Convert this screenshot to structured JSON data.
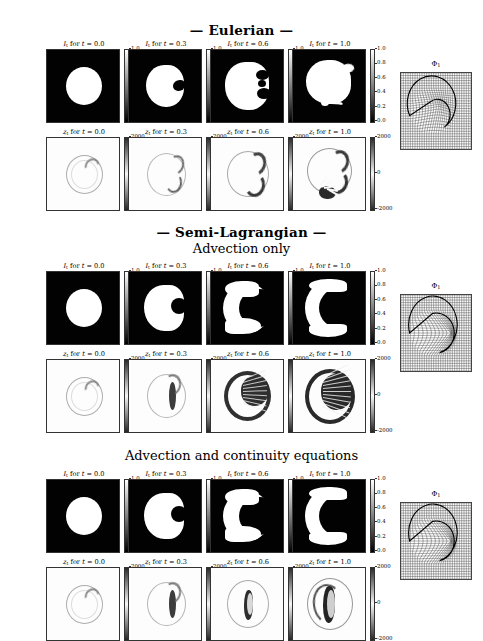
{
  "figure": {
    "width": 483,
    "height": 641,
    "background": "#ffffff",
    "kind": "scientific-figure-grid"
  },
  "sections": [
    {
      "id": "eulerian",
      "title": "—  Eulerian  —",
      "subtitle": null,
      "title_y": 22,
      "rows": [
        {
          "id": "eulerian-It",
          "quantity": "I",
          "quantity_sub": "t",
          "y": 40,
          "cmap": "gray",
          "cbar_ticks": [
            "1.0",
            "0.8",
            "0.6",
            "0.4",
            "0.2",
            "0.0"
          ],
          "panels": [
            {
              "time": "0.0",
              "label": "I_t for t = 0.0",
              "shape": "circle"
            },
            {
              "time": "0.3",
              "label": "I_t for t = 0.3",
              "shape": "notched-circle"
            },
            {
              "time": "0.6",
              "label": "I_t for t = 0.6",
              "shape": "lobed-blob"
            },
            {
              "time": "1.0",
              "label": "I_t for t = 1.0",
              "shape": "blob-with-spray"
            }
          ]
        },
        {
          "id": "eulerian-zt",
          "quantity": "z",
          "quantity_sub": "t",
          "y": 128,
          "cmap": "diverging",
          "cbar_ticks": [
            "2000",
            "0",
            "-2000"
          ],
          "panels": [
            {
              "time": "0.0",
              "label": "z_t for t = 0.0",
              "shape": "ring-faint"
            },
            {
              "time": "0.3",
              "label": "z_t for t = 0.3",
              "shape": "ring-arc"
            },
            {
              "time": "0.6",
              "label": "z_t for t = 0.6",
              "shape": "ring-arc-strong"
            },
            {
              "time": "1.0",
              "label": "z_t for t = 1.0",
              "shape": "ring-blot"
            }
          ]
        }
      ],
      "phi": {
        "label": "Φ",
        "label_sub": "1",
        "style": "eulerian-warp",
        "y": 60
      }
    },
    {
      "id": "semi-lagrangian-advection",
      "title": "—  Semi-Lagrangian  —",
      "subtitle": "Advection only",
      "title_y": 224,
      "subtitle_y": 241,
      "rows": [
        {
          "id": "sl-adv-It",
          "quantity": "I",
          "quantity_sub": "t",
          "y": 262,
          "cmap": "gray",
          "cbar_ticks": [
            "1.0",
            "0.8",
            "0.6",
            "0.4",
            "0.2",
            "0.0"
          ],
          "panels": [
            {
              "time": "0.0",
              "label": "I_t for t = 0.0",
              "shape": "circle"
            },
            {
              "time": "0.3",
              "label": "I_t for t = 0.3",
              "shape": "dented-disc"
            },
            {
              "time": "0.6",
              "label": "I_t for t = 0.6",
              "shape": "crescent"
            },
            {
              "time": "1.0",
              "label": "I_t for t = 1.0",
              "shape": "crescent-open"
            }
          ]
        },
        {
          "id": "sl-adv-zt",
          "quantity": "z",
          "quantity_sub": "t",
          "y": 350,
          "cmap": "diverging",
          "cbar_ticks": [
            "2000",
            "0",
            "-2000"
          ],
          "panels": [
            {
              "time": "0.0",
              "label": "z_t for t = 0.0",
              "shape": "ring-faint"
            },
            {
              "time": "0.3",
              "label": "z_t for t = 0.3",
              "shape": "ring-streak"
            },
            {
              "time": "0.6",
              "label": "z_t for t = 0.6",
              "shape": "crescent-dark"
            },
            {
              "time": "1.0",
              "label": "z_t for t = 1.0",
              "shape": "crescent-dark-open"
            }
          ]
        }
      ],
      "phi": {
        "label": "Φ",
        "label_sub": "1",
        "style": "crescent-warp",
        "y": 282
      }
    },
    {
      "id": "semi-lagrangian-continuity",
      "title": null,
      "subtitle": "Advection and continuity equations",
      "subtitle_y": 448,
      "rows": [
        {
          "id": "sl-cont-It",
          "quantity": "I",
          "quantity_sub": "t",
          "y": 470,
          "cmap": "gray",
          "cbar_ticks": [
            "1.0",
            "0.8",
            "0.6",
            "0.4",
            "0.2",
            "0.0"
          ],
          "panels": [
            {
              "time": "0.0",
              "label": "I_t for t = 0.0",
              "shape": "circle"
            },
            {
              "time": "0.3",
              "label": "I_t for t = 0.3",
              "shape": "dented-disc"
            },
            {
              "time": "0.6",
              "label": "I_t for t = 0.6",
              "shape": "crescent"
            },
            {
              "time": "1.0",
              "label": "I_t for t = 1.0",
              "shape": "crescent-open"
            }
          ]
        },
        {
          "id": "sl-cont-zt",
          "quantity": "z",
          "quantity_sub": "t",
          "y": 558,
          "cmap": "diverging",
          "cbar_ticks": [
            "2000",
            "0",
            "-2000"
          ],
          "panels": [
            {
              "time": "0.0",
              "label": "z_t for t = 0.0",
              "shape": "ring-faint"
            },
            {
              "time": "0.3",
              "label": "z_t for t = 0.3",
              "shape": "ring-streak"
            },
            {
              "time": "0.6",
              "label": "z_t for t = 0.6",
              "shape": "arc-thin"
            },
            {
              "time": "1.0",
              "label": "z_t for t = 1.0",
              "shape": "arc-thin-strong"
            }
          ]
        }
      ],
      "phi": {
        "label": "Φ",
        "label_sub": "1",
        "style": "crescent-warp",
        "y": 490
      }
    }
  ],
  "columns": {
    "x_positions": [
      46,
      128,
      210,
      292
    ],
    "panel_width": 74,
    "panel_height": 74,
    "phi_x": 400
  },
  "chart_data": {
    "type": "heatmap",
    "times": [
      0.0,
      0.3,
      0.6,
      1.0
    ],
    "series": [
      {
        "name": "Eulerian I_t",
        "cbar_range": [
          0.0,
          1.0
        ],
        "cbar_ticks": [
          0.0,
          0.2,
          0.4,
          0.6,
          0.8,
          1.0
        ]
      },
      {
        "name": "Eulerian z_t",
        "cbar_range": [
          -2000,
          2000
        ],
        "cbar_ticks": [
          -2000,
          0,
          2000
        ]
      },
      {
        "name": "Semi-Lagrangian (advection only) I_t",
        "cbar_range": [
          0.0,
          1.0
        ],
        "cbar_ticks": [
          0.0,
          0.2,
          0.4,
          0.6,
          0.8,
          1.0
        ]
      },
      {
        "name": "Semi-Lagrangian (advection only) z_t",
        "cbar_range": [
          -2000,
          2000
        ],
        "cbar_ticks": [
          -2000,
          0,
          2000
        ]
      },
      {
        "name": "Semi-Lagrangian (advection and continuity) I_t",
        "cbar_range": [
          0.0,
          1.0
        ],
        "cbar_ticks": [
          0.0,
          0.2,
          0.4,
          0.6,
          0.8,
          1.0
        ]
      },
      {
        "name": "Semi-Lagrangian (advection and continuity) z_t",
        "cbar_range": [
          -2000,
          2000
        ],
        "cbar_ticks": [
          -2000,
          0,
          2000
        ]
      }
    ],
    "xlabel": "",
    "ylabel": "",
    "grid": false,
    "legend": "none",
    "colormaps": {
      "intensity": "gray",
      "momentum": "diverging-gray"
    }
  }
}
